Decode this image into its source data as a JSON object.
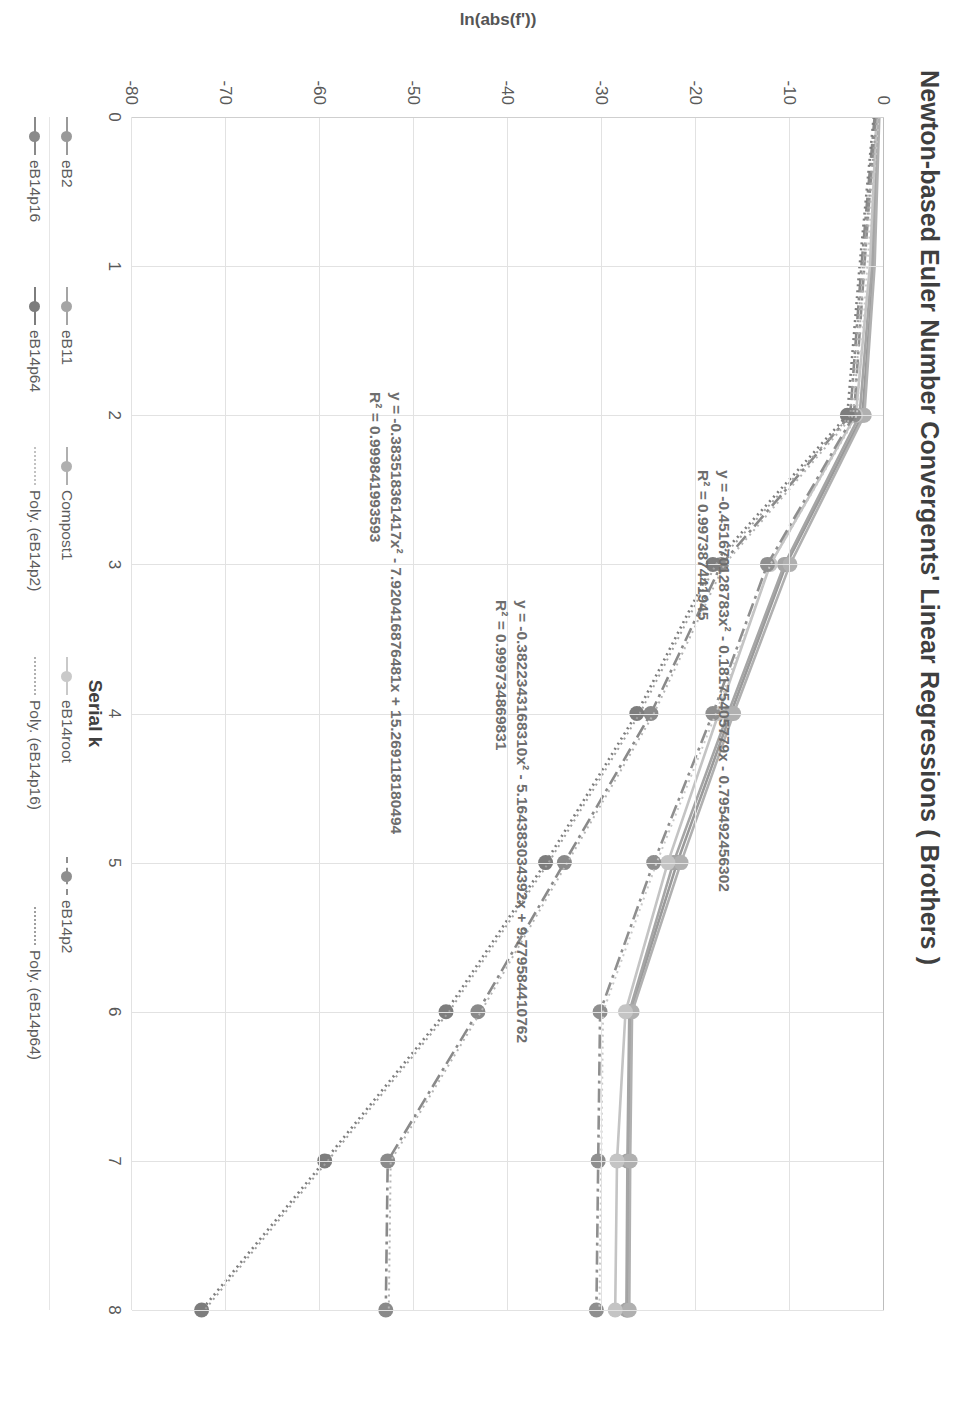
{
  "chart_data": {
    "type": "line",
    "title": "Newton-based Euler Number Convergents' Linear Regressions ( Brothers )",
    "xlabel": "Serial k",
    "ylabel": "ln(abs(f'))",
    "xlim": [
      0,
      8
    ],
    "ylim": [
      -80,
      0
    ],
    "grid": true,
    "legend_position": "bottom",
    "x_ticks": [
      "0",
      "1",
      "2",
      "3",
      "4",
      "5",
      "6",
      "7",
      "8"
    ],
    "y_ticks": [
      "0",
      "-10",
      "-20",
      "-30",
      "-40",
      "-50",
      "-60",
      "-70",
      "-80"
    ],
    "x": [
      0,
      1,
      2,
      3,
      4,
      5,
      6,
      7,
      8
    ],
    "series": [
      {
        "name": "eB2",
        "color": "#9a9a9a",
        "dash": "solid",
        "values": [
          -0.6,
          -1.1,
          -2.3,
          -10.4,
          -16.3,
          -22.0,
          -27.0,
          -27.2,
          -27.3
        ]
      },
      {
        "name": "eB11",
        "color": "#a5a5a5",
        "dash": "solid",
        "values": [
          -0.7,
          -1.3,
          -2.6,
          -10.6,
          -16.6,
          -22.4,
          -27.1,
          -27.3,
          -27.4
        ]
      },
      {
        "name": "Compost1",
        "color": "#b0b0b0",
        "dash": "solid",
        "values": [
          -0.5,
          -1.0,
          -2.1,
          -10.0,
          -16.0,
          -21.6,
          -26.8,
          -27.0,
          -27.1
        ]
      },
      {
        "name": "eB14root",
        "color": "#c4c4c4",
        "dash": "solid",
        "values": [
          -0.8,
          -1.5,
          -3.0,
          -12.1,
          -17.6,
          -23.0,
          -27.5,
          -28.4,
          -28.6
        ]
      },
      {
        "name": "eB14p2",
        "color": "#8f8f8f",
        "dash": "dashdot",
        "values": [
          -0.9,
          -2.1,
          -3.2,
          -12.4,
          -18.2,
          -24.5,
          -30.2,
          -30.4,
          -30.6
        ]
      },
      {
        "name": "eB14p16",
        "color": "#8a8a8a",
        "dash": "dashdot",
        "values": [
          -1.0,
          -2.4,
          -3.6,
          -17.3,
          -24.8,
          -34.0,
          -43.2,
          -52.8,
          -53.0
        ]
      },
      {
        "name": "eB14p64",
        "color": "#7d7d7d",
        "dash": "dotted",
        "values": [
          -1.1,
          -2.6,
          -3.9,
          -18.2,
          -26.3,
          -36.0,
          -46.6,
          -59.5,
          -72.6
        ]
      }
    ],
    "trendlines": [
      {
        "for": "eB14p2",
        "style": "dotted",
        "color": "#c9c9c9"
      },
      {
        "for": "eB14p16",
        "style": "dotted",
        "color": "#b5b5b5"
      },
      {
        "for": "eB14p64",
        "style": "dotted",
        "color": "#a0a0a0"
      }
    ],
    "annotations": [
      {
        "id": "annot-1",
        "equation": "y = -0.451670128783x² - 0.18175405779x - 0.795492456302",
        "r2": "R² = 0.997387441945"
      },
      {
        "id": "annot-2",
        "equation": "y = -0.3822343168310x² - 5.164383034392x + 9.779584410762",
        "r2": "R² = 0.999734869831"
      },
      {
        "id": "annot-3",
        "equation": "y = -0.383518361417x² - 7.920416876481x + 15.269118180494",
        "r2": "R² = 0.999841993593"
      }
    ],
    "legend_rows": [
      [
        {
          "label": "eB2",
          "color": "#9a9a9a",
          "dash": "solid",
          "marker": true
        },
        {
          "label": "eB11",
          "color": "#a5a5a5",
          "dash": "solid",
          "marker": true
        },
        {
          "label": "Compost1",
          "color": "#b0b0b0",
          "dash": "solid",
          "marker": true
        },
        {
          "label": "eB14root",
          "color": "#c9c9c9",
          "dash": "solid",
          "marker": true
        },
        {
          "label": "eB14p2",
          "color": "#8f8f8f",
          "dash": "dashdot",
          "marker": true
        }
      ],
      [
        {
          "label": "eB14p16",
          "color": "#8a8a8a",
          "dash": "solid",
          "marker": true
        },
        {
          "label": "eB14p64",
          "color": "#7d7d7d",
          "dash": "solid",
          "marker": true
        },
        {
          "label": "Poly. (eB14p2)",
          "color": "#c2c2c2",
          "dash": "dotted",
          "marker": false
        },
        {
          "label": "Poly. (eB14p16)",
          "color": "#b0b0b0",
          "dash": "dotted",
          "marker": false
        },
        {
          "label": "Poly. (eB14p64)",
          "color": "#9e9e9e",
          "dash": "dotted",
          "marker": false
        }
      ]
    ]
  }
}
